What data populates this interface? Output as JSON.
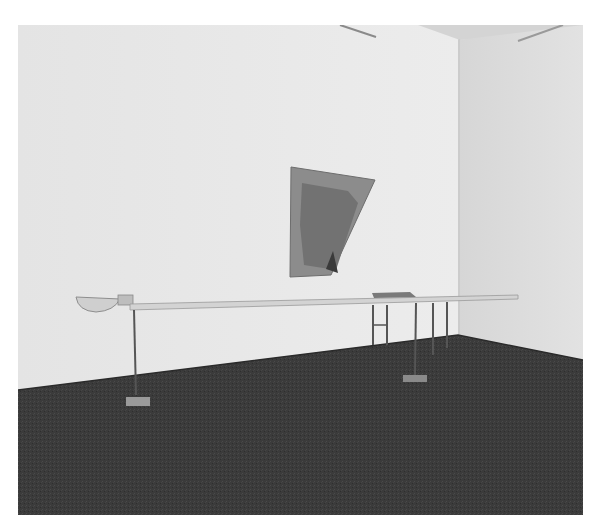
{
  "image": {
    "kind": "black-and-white gallery installation photograph",
    "colors": {
      "page_background": "#ffffff",
      "wall_left": "#e6e6e6",
      "wall_right": "#dcdcdc",
      "ceiling": "#d8d8d8",
      "floor": "#3a3a3a",
      "wall_artwork": "#8a8a8a",
      "artwork_inner": "#6f6f6f",
      "pole": "#cfcfcf",
      "legs": "#555555"
    }
  }
}
